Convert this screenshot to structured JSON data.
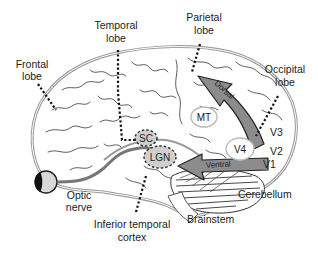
{
  "diagram": {
    "type": "brain-visual-pathways",
    "lobe_labels": {
      "frontal": [
        "Frontal",
        "lobe"
      ],
      "temporal": [
        "Temporal",
        "lobe"
      ],
      "parietal": [
        "Parietal",
        "lobe"
      ],
      "occipital": [
        "Occipital",
        "lobe"
      ]
    },
    "region_labels": {
      "sc": "SC",
      "lgn": "LGN",
      "mt": "MT",
      "v4": "V4",
      "v1": "V1",
      "v2": "V2",
      "v3": "V3"
    },
    "pathways": {
      "dorsal": "Dorsal",
      "ventral": "Ventral"
    },
    "structure_labels": {
      "optic_nerve": [
        "Optic",
        "nerve"
      ],
      "inferior_temporal": [
        "Inferior temporal",
        "cortex"
      ],
      "brainstem": "Brainstem",
      "cerebellum": "Cerebellum"
    },
    "colors": {
      "outline": "#9a9a9a",
      "arrow_fill": "#8c8c8c",
      "nucleus_fill": "#cfcfcf",
      "eye_fill": "#d8d8d8",
      "pupil": "#111111"
    }
  }
}
